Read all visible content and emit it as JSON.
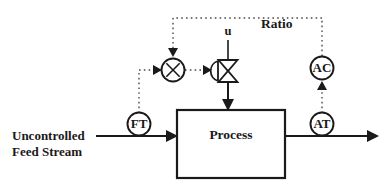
{
  "diagram": {
    "ratio_label": "Ratio",
    "manipulated_input_label": "u",
    "feed_label_line1": "Uncontrolled",
    "feed_label_line2": "Feed Stream",
    "process_block_label": "Process",
    "multiplier_symbol": "×",
    "instruments": [
      {
        "tag": "FT",
        "name": "flow-transmitter"
      },
      {
        "tag": "AC",
        "name": "analyzer-controller"
      },
      {
        "tag": "AT",
        "name": "analyzer-transmitter"
      }
    ],
    "colors": {
      "line": "#1a1a1a",
      "signal": "#4a4a4a",
      "background": "#ffffff"
    }
  }
}
